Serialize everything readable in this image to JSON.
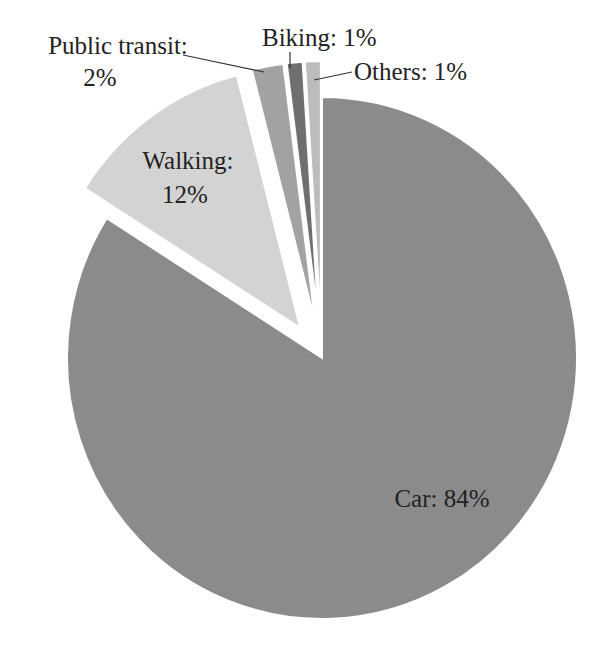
{
  "chart_data": {
    "type": "pie",
    "title": "",
    "categories": [
      "Car",
      "Walking",
      "Public transit",
      "Biking",
      "Others"
    ],
    "values": [
      84,
      12,
      2,
      1,
      1
    ],
    "unit": "%",
    "labels": [
      "Car: 84%",
      "Walking: 12%",
      "Public transit: 2%",
      "Biking: 1%",
      "Others: 1%"
    ],
    "colors": [
      "#8b8b8b",
      "#d3d3d3",
      "#a2a2a2",
      "#6f6f6f",
      "#bcbcbc"
    ],
    "exploded": [
      "Walking",
      "Public transit",
      "Biking",
      "Others"
    ],
    "start_angle_deg": 0,
    "direction": "clockwise",
    "legend": "none"
  },
  "labels": {
    "car": "Car: 84%",
    "walking_line1": "Walking:",
    "walking_line2": "12%",
    "transit_line1": "Public transit:",
    "transit_line2": "2%",
    "biking": "Biking: 1%",
    "others": "Others: 1%"
  }
}
